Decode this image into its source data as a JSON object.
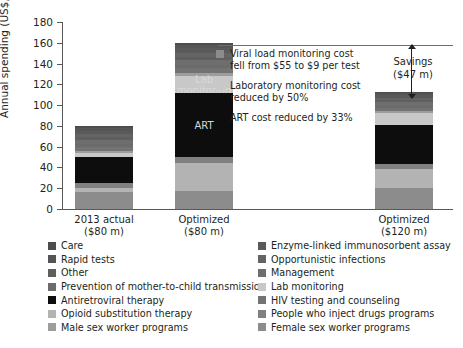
{
  "chart_data": {
    "type": "bar",
    "subtype": "stacked-bar",
    "title": "",
    "xlabel": "",
    "ylabel": "Annual spending (US$, million)",
    "ylim": [
      0,
      180
    ],
    "yticks": [
      0,
      20,
      40,
      60,
      80,
      100,
      120,
      140,
      160,
      180
    ],
    "grid": false,
    "legend_position": "bottom",
    "categories": [
      "2013 actual\n($80 m)",
      "Optimized\n($80 m)",
      "Optimized\n($120 m)"
    ],
    "category_labels": [
      {
        "line1": "2013 actual",
        "line2": "($80 m)"
      },
      {
        "line1": "Optimized",
        "line2": "($80 m)"
      },
      {
        "line1": "Optimized",
        "line2": "($120 m)"
      }
    ],
    "totals": [
      80,
      160,
      113
    ],
    "series": [
      {
        "name": "Care",
        "color": "#4d4d4d",
        "values": [
          2.0,
          2.5,
          1.5
        ]
      },
      {
        "name": "Rapid tests",
        "color": "#555555",
        "values": [
          2.5,
          3.0,
          2.0
        ]
      },
      {
        "name": "Other",
        "color": "#5f5f5f",
        "values": [
          2.5,
          3.0,
          2.0
        ]
      },
      {
        "name": "Prevention of mother-to-child transmission",
        "color": "#6b6b6b",
        "values": [
          3.0,
          3.5,
          2.0
        ]
      },
      {
        "name": "Antiretroviral therapy",
        "color": "#0d0d0d",
        "values": [
          25.0,
          61.5,
          38.0
        ]
      },
      {
        "name": "Opioid substitution therapy",
        "color": "#b3b3b3",
        "values": [
          4.0,
          27.0,
          18.5
        ]
      },
      {
        "name": "Male sex worker programs",
        "color": "#9d9d9d",
        "values": [
          2.0,
          3.0,
          2.0
        ]
      },
      {
        "name": "Enzyme-linked immunosorbent assay",
        "color": "#5a5a5a",
        "values": [
          3.5,
          4.0,
          2.5
        ]
      },
      {
        "name": "Opportunistic infections",
        "color": "#646464",
        "values": [
          3.0,
          4.0,
          2.5
        ]
      },
      {
        "name": "Management",
        "color": "#6e6e6e",
        "values": [
          3.5,
          4.5,
          3.0
        ]
      },
      {
        "name": "Lab monitoring",
        "color": "#c8c8c8",
        "values": [
          4.0,
          16.0,
          11.0
        ]
      },
      {
        "name": "HIV testing and counseling",
        "color": "#737373",
        "values": [
          4.0,
          5.0,
          3.5
        ]
      },
      {
        "name": "People who inject drugs programs",
        "color": "#808080",
        "values": [
          5.0,
          6.0,
          4.5
        ]
      },
      {
        "name": "Female sex worker programs",
        "color": "#8c8c8c",
        "values": [
          16.0,
          17.0,
          20.0
        ]
      }
    ],
    "inline_labels": [
      {
        "text": "ART",
        "bar": "Optimized ($80 m)"
      },
      {
        "text": "Lab\nmonitoring",
        "bar": "Optimized ($80 m)"
      }
    ],
    "annotations": [
      {
        "text": "Savings\n($47 m)",
        "value": 47,
        "from": 160,
        "to": 113
      }
    ]
  },
  "axis": {
    "y_title": "Annual spending (US$, million)",
    "y_ticks": [
      "180",
      "160",
      "140",
      "120",
      "100",
      "80",
      "60",
      "40",
      "20",
      "0"
    ],
    "x_labels": [
      {
        "line1": "2013 actual",
        "line2": "($80 m)"
      },
      {
        "line1": "Optimized",
        "line2": "($80 m)"
      },
      {
        "line1": "Optimized",
        "line2": "($120 m)"
      }
    ]
  },
  "bar_inline_labels": {
    "art": "ART",
    "lab_line1": "Lab",
    "lab_line2": "monitoring"
  },
  "savings": {
    "line1": "Savings",
    "line2": "($47 m)"
  },
  "notes": [
    {
      "color": "#8c8c8c",
      "line1": "Viral load monitoring cost",
      "line2": "fell from $55 to $9 per test"
    },
    {
      "color": "#c8c8c8",
      "line1": "Laboratory monitoring cost",
      "line2": "reduced  by 50%"
    },
    {
      "color": "#0d0d0d",
      "line1": "ART cost reduced by 33%",
      "line2": ""
    }
  ],
  "legend": {
    "left": [
      {
        "label": "Care",
        "color": "#4d4d4d"
      },
      {
        "label": "Rapid tests",
        "color": "#555555"
      },
      {
        "label": "Other",
        "color": "#5f5f5f"
      },
      {
        "label": "Prevention of mother-to-child transmission",
        "color": "#6b6b6b"
      },
      {
        "label": "Antiretroviral therapy",
        "color": "#0d0d0d"
      },
      {
        "label": "Opioid substitution therapy",
        "color": "#b3b3b3"
      },
      {
        "label": "Male sex worker programs",
        "color": "#9d9d9d"
      }
    ],
    "right": [
      {
        "label": "Enzyme-linked immunosorbent assay",
        "color": "#5a5a5a"
      },
      {
        "label": "Opportunistic infections",
        "color": "#646464"
      },
      {
        "label": "Management",
        "color": "#6e6e6e"
      },
      {
        "label": "Lab monitoring",
        "color": "#c8c8c8"
      },
      {
        "label": "HIV testing and counseling",
        "color": "#737373"
      },
      {
        "label": "People who inject drugs programs",
        "color": "#808080"
      },
      {
        "label": "Female sex worker programs",
        "color": "#8c8c8c"
      }
    ]
  },
  "layout": {
    "bar_geometry": [
      {
        "left": 12,
        "width": 58
      },
      {
        "left": 112,
        "width": 58
      },
      {
        "left": 312,
        "width": 58
      }
    ]
  }
}
